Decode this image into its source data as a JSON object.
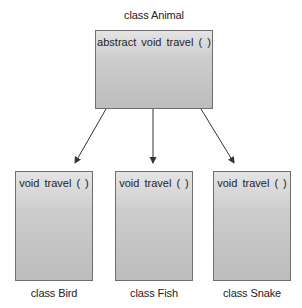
{
  "diagram": {
    "type": "class-hierarchy",
    "parent": {
      "class_label": "class Animal",
      "method": "abstract  void  travel ( )"
    },
    "children": [
      {
        "class_label": "class Bird",
        "method": "void  travel ( )"
      },
      {
        "class_label": "class Fish",
        "method": "void  travel ( )"
      },
      {
        "class_label": "class Snake",
        "method": "void  travel ( )"
      }
    ],
    "edges": [
      {
        "from": "class Animal",
        "to": "class Bird"
      },
      {
        "from": "class Animal",
        "to": "class Fish"
      },
      {
        "from": "class Animal",
        "to": "class Snake"
      }
    ],
    "colors": {
      "box_fill_top": "#e4e4e4",
      "box_fill_bottom": "#bcbcbc",
      "box_border": "#6e6e6e",
      "arrow": "#333333",
      "text": "#222222"
    }
  }
}
